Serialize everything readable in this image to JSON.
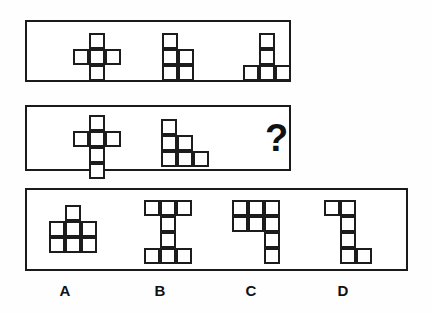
{
  "puzzle": {
    "type": "visual-analogy-matrix",
    "cell_size": 16,
    "colors": {
      "stroke": "#1c1c1c",
      "panel_border": "#1a1a1a",
      "fill": "#ffffff",
      "background": "#ffffff",
      "text": "#111111"
    },
    "panels": [
      {
        "id": "panel-top",
        "name": "sequence-row-1",
        "shapes": [
          {
            "id": "shape-1-1",
            "name": "plus-pentomino",
            "cells": [
              [
                1,
                0
              ],
              [
                0,
                1
              ],
              [
                1,
                1
              ],
              [
                2,
                1
              ],
              [
                1,
                2
              ]
            ],
            "cols": 3,
            "rows": 3,
            "left": 46,
            "top": 11
          },
          {
            "id": "shape-1-2",
            "name": "p-pentomino",
            "cells": [
              [
                0,
                0
              ],
              [
                0,
                1
              ],
              [
                1,
                1
              ],
              [
                0,
                2
              ],
              [
                1,
                2
              ]
            ],
            "cols": 2,
            "rows": 3,
            "left": 135,
            "top": 11
          },
          {
            "id": "shape-1-3",
            "name": "t-pentomino",
            "cells": [
              [
                1,
                0
              ],
              [
                1,
                1
              ],
              [
                0,
                2
              ],
              [
                1,
                2
              ],
              [
                2,
                2
              ]
            ],
            "cols": 3,
            "rows": 3,
            "left": 216,
            "top": 11
          }
        ]
      },
      {
        "id": "panel-middle",
        "name": "sequence-row-2",
        "shapes": [
          {
            "id": "shape-2-1",
            "name": "latin-cross-hexomino",
            "cells": [
              [
                1,
                0
              ],
              [
                0,
                1
              ],
              [
                1,
                1
              ],
              [
                2,
                1
              ],
              [
                1,
                2
              ],
              [
                1,
                3
              ]
            ],
            "cols": 3,
            "rows": 4,
            "left": 46,
            "top": 8
          },
          {
            "id": "shape-2-2",
            "name": "staircase-hexomino",
            "cells": [
              [
                0,
                0
              ],
              [
                0,
                1
              ],
              [
                1,
                1
              ],
              [
                0,
                2
              ],
              [
                1,
                2
              ],
              [
                2,
                2
              ]
            ],
            "cols": 3,
            "rows": 3,
            "left": 134,
            "top": 12
          }
        ],
        "question_mark": {
          "name": "question-mark",
          "text": "?",
          "left": 238,
          "top": 12
        }
      },
      {
        "id": "panel-answers",
        "name": "answer-options-row",
        "options": [
          {
            "id": "option-a",
            "label": "A",
            "name": "answer-option-a",
            "cells": [
              [
                1,
                0
              ],
              [
                0,
                1
              ],
              [
                1,
                1
              ],
              [
                2,
                1
              ],
              [
                0,
                2
              ],
              [
                1,
                2
              ],
              [
                2,
                2
              ]
            ],
            "cols": 3,
            "rows": 3,
            "left": 22,
            "top": 15,
            "label_left": 55,
            "label_top": 282
          },
          {
            "id": "option-b",
            "label": "B",
            "name": "answer-option-b",
            "cells": [
              [
                0,
                0
              ],
              [
                1,
                0
              ],
              [
                2,
                0
              ],
              [
                1,
                1
              ],
              [
                1,
                2
              ],
              [
                0,
                3
              ],
              [
                1,
                3
              ],
              [
                2,
                3
              ]
            ],
            "cols": 3,
            "rows": 4,
            "left": 117,
            "top": 10,
            "label_left": 150,
            "label_top": 282
          },
          {
            "id": "option-c",
            "label": "C",
            "name": "answer-option-c",
            "cells": [
              [
                0,
                0
              ],
              [
                1,
                0
              ],
              [
                2,
                0
              ],
              [
                0,
                1
              ],
              [
                1,
                1
              ],
              [
                2,
                1
              ],
              [
                2,
                2
              ],
              [
                2,
                3
              ]
            ],
            "cols": 3,
            "rows": 4,
            "left": 205,
            "top": 10,
            "label_left": 241,
            "label_top": 282
          },
          {
            "id": "option-d",
            "label": "D",
            "name": "answer-option-d",
            "cells": [
              [
                0,
                0
              ],
              [
                1,
                0
              ],
              [
                1,
                1
              ],
              [
                1,
                2
              ],
              [
                1,
                3
              ],
              [
                2,
                3
              ]
            ],
            "cols": 3,
            "rows": 4,
            "left": 297,
            "top": 10,
            "label_left": 333,
            "label_top": 282
          }
        ]
      }
    ]
  }
}
